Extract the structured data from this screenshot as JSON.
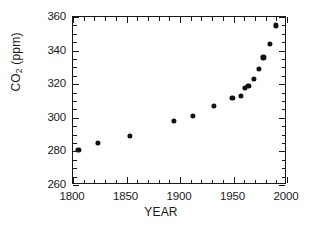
{
  "chart_data": {
    "type": "scatter",
    "title": "",
    "xlabel": "YEAR",
    "ylabel": "CO2 (ppm)",
    "ylabel_parts": {
      "species": "CO",
      "subscript": "2",
      "units": " (ppm)"
    },
    "xlim": [
      1800,
      2000
    ],
    "ylim": [
      260,
      360
    ],
    "xticks": [
      1800,
      1850,
      1900,
      1950,
      2000
    ],
    "xticklabels": [
      "1800",
      "1850",
      "1900",
      "1950",
      "2000"
    ],
    "yticks": [
      260,
      280,
      300,
      320,
      340,
      360
    ],
    "yticklabels": [
      "260",
      "280",
      "300",
      "320",
      "340",
      "360"
    ],
    "x_minor_tick_step": 10,
    "y_minor_tick_step": 5,
    "grid": false,
    "legend": null,
    "marker": "filled-circle",
    "marker_color": "#111111",
    "series": [
      {
        "name": "Atmospheric CO2",
        "points": [
          {
            "x": 1805,
            "y": 281
          },
          {
            "x": 1823,
            "y": 285
          },
          {
            "x": 1853,
            "y": 289
          },
          {
            "x": 1894,
            "y": 298
          },
          {
            "x": 1912,
            "y": 301
          },
          {
            "x": 1932,
            "y": 307
          },
          {
            "x": 1949,
            "y": 312
          },
          {
            "x": 1957,
            "y": 313
          },
          {
            "x": 1961,
            "y": 318
          },
          {
            "x": 1964,
            "y": 319
          },
          {
            "x": 1969,
            "y": 323
          },
          {
            "x": 1974,
            "y": 329
          },
          {
            "x": 1978,
            "y": 336
          },
          {
            "x": 1984,
            "y": 344
          },
          {
            "x": 1990,
            "y": 355
          }
        ]
      }
    ]
  }
}
